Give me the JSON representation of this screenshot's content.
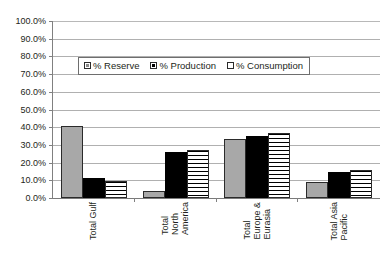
{
  "chart_data": {
    "type": "bar",
    "title": "",
    "xlabel": "",
    "ylabel": "",
    "ylim": [
      0,
      100
    ],
    "ytick_labels": [
      "100.0%",
      "90.0%",
      "80.0%",
      "70.0%",
      "60.0%",
      "50.0%",
      "40.0%",
      "30.0%",
      "20.0%",
      "10.0%",
      "0.0%"
    ],
    "ytick_values": [
      100,
      90,
      80,
      70,
      60,
      50,
      40,
      30,
      20,
      10,
      0
    ],
    "grid": true,
    "legend_position": "upper-center",
    "categories": [
      "Total Gulf",
      "Total North America",
      "Total Europe & Eurasia",
      "Total Asia Pacific"
    ],
    "category_lines": [
      [
        "Total Gulf"
      ],
      [
        "Total",
        "North",
        "America"
      ],
      [
        "Total",
        "Europe &",
        "Eurasia"
      ],
      [
        "Total Asia",
        "Pacific"
      ]
    ],
    "series": [
      {
        "name": "% Reserve",
        "color": "#a8a8a8",
        "pattern": "solid-gray",
        "values": [
          40.5,
          4.0,
          33.5,
          9.0
        ]
      },
      {
        "name": "% Production",
        "color": "#000000",
        "pattern": "solid-black",
        "values": [
          11.5,
          26.0,
          35.0,
          14.5
        ]
      },
      {
        "name": "% Consumption",
        "color": "#ffffff",
        "pattern": "horizontal-lines",
        "values": [
          9.5,
          27.0,
          36.5,
          16.0
        ]
      }
    ]
  },
  "legend": {
    "items": [
      {
        "label": "% Reserve"
      },
      {
        "label": "% Production"
      },
      {
        "label": "% Consumption"
      }
    ]
  }
}
